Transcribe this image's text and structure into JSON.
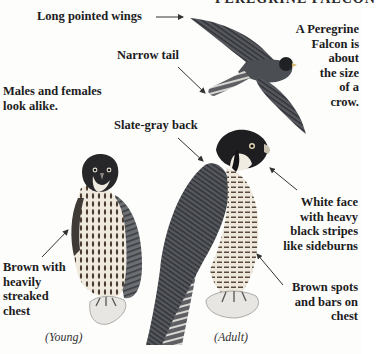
{
  "page": {
    "title_partial": "PEREGRINE FALCON"
  },
  "labels": {
    "long_wings": "Long pointed wings",
    "narrow_tail": "Narrow tail",
    "size_note": [
      "A Peregrine",
      "Falcon is",
      "about",
      "the size",
      "of a",
      "crow."
    ],
    "males_females": [
      "Males and females",
      "look alike."
    ],
    "slate_back": "Slate-gray back",
    "white_face": [
      "White face",
      "with heavy",
      "black stripes",
      "like sideburns"
    ],
    "brown_spots": [
      "Brown spots",
      "and bars on",
      "chest"
    ],
    "brown_streaked": [
      "Brown with",
      "heavily",
      "streaked",
      "chest"
    ]
  },
  "captions": {
    "young": "(Young)",
    "adult": "(Adult)"
  },
  "colors": {
    "ink": "#1c1c1c",
    "slate": "#4a4d52",
    "dark": "#1f1f22",
    "cream": "#ece6da",
    "brown": "#5a4a3c",
    "arrow": "#333333"
  }
}
